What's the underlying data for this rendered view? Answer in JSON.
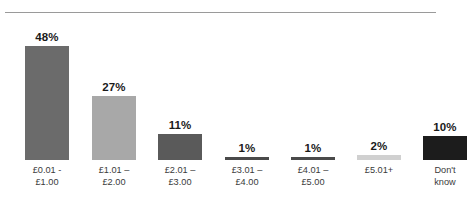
{
  "chart_data": {
    "type": "bar",
    "title": "",
    "subtitle": "",
    "xlabel": "",
    "ylabel": "",
    "ylim": [
      0,
      50
    ],
    "grid": false,
    "legend": "none",
    "categories": [
      "£0.01 -\n£1.00",
      "£1.01 –\n£2.00",
      "£2.01 –\n£3.00",
      "£3.01 –\n£4.00",
      "£4.01 –\n£5.00",
      "£5.01+",
      "Don't\nknow"
    ],
    "values": [
      48,
      27,
      11,
      1,
      1,
      2,
      10
    ],
    "value_labels": [
      "48%",
      "27%",
      "11%",
      "1%",
      "1%",
      "2%",
      "10%"
    ],
    "bar_colors": [
      "#6b6b6b",
      "#a8a8a8",
      "#5a5a5a",
      "#4a4a4a",
      "#4a4a4a",
      "#d0d0d0",
      "#1c1c1c"
    ]
  },
  "layout": {
    "background": "#ffffff",
    "rule_color": "#9a9a9a",
    "label_color": "#3a3a3a",
    "value_color": "#1a1a1a"
  }
}
